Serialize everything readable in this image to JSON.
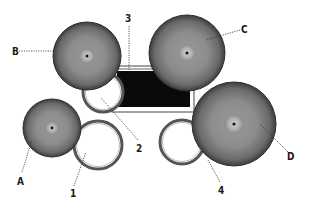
{
  "diagram": {
    "colors": {
      "background": "#ffffff",
      "cymbal_edge": "#3a3a3a",
      "cymbal_mid": "#8a8a8a",
      "cymbal_bell": "#b0b0b0",
      "bass_drum": "#0a0a0a",
      "drum_shell": "#555555",
      "leader_line": "#333333"
    },
    "cymbals": [
      {
        "id": "A",
        "label": "A",
        "cx": 52,
        "cy": 128,
        "r": 29
      },
      {
        "id": "B",
        "label": "B",
        "cx": 87,
        "cy": 56,
        "r": 34
      },
      {
        "id": "C",
        "label": "C",
        "cx": 187,
        "cy": 53,
        "r": 38
      },
      {
        "id": "D",
        "label": "D",
        "cx": 234,
        "cy": 124,
        "r": 42
      }
    ],
    "drums": [
      {
        "id": "1",
        "label": "1",
        "cx": 98,
        "cy": 145,
        "r": 24
      },
      {
        "id": "2",
        "label": "2",
        "cx": 103,
        "cy": 92,
        "r": 20
      },
      {
        "id": "3",
        "label": "3",
        "type": "bass-drum"
      },
      {
        "id": "4",
        "label": "4",
        "cx": 182,
        "cy": 142,
        "r": 22
      }
    ],
    "labels": {
      "A": "A",
      "B": "B",
      "C": "C",
      "D": "D",
      "one": "1",
      "two": "2",
      "three": "3",
      "four": "4"
    }
  }
}
